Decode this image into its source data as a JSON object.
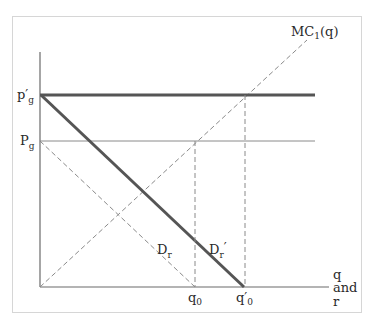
{
  "diagram": {
    "type": "economics-supply-demand",
    "labels": {
      "mc_curve": "MC",
      "mc_sub": "1",
      "mc_arg": "(q)",
      "p_prime": "p′",
      "p_prime_sub": "g",
      "p": "P",
      "p_sub": "g",
      "dr": "D",
      "dr_sub": "r",
      "dr_prime": "D",
      "dr_prime_sub": "r",
      "dr_prime_mark": "′",
      "q0": "q",
      "q0_sub": "0",
      "q0_prime": "q′",
      "q0_prime_sub": "0",
      "x_axis_line1": "q",
      "x_axis_line2": "and",
      "x_axis_line3": "r"
    },
    "colors": {
      "thick_line": "#555555",
      "thin_line": "#8a8a8a",
      "dashed_line": "#8a8a8a",
      "axis": "#6a6a6a",
      "frame": "#d6d6d6",
      "text": "#2a2a2a"
    },
    "elements": [
      {
        "name": "p_prime_g price line",
        "style": "thick solid horizontal"
      },
      {
        "name": "p_g price line",
        "style": "thin solid horizontal"
      },
      {
        "name": "D_r prime demand curve",
        "style": "thick solid diagonal"
      },
      {
        "name": "D_r demand curve",
        "style": "dashed diagonal"
      },
      {
        "name": "MC_1(q) marginal cost curve",
        "style": "dashed diagonal from origin"
      },
      {
        "name": "q_0 drop line",
        "style": "dashed vertical"
      },
      {
        "name": "q_0 prime drop line",
        "style": "dashed vertical"
      }
    ]
  }
}
